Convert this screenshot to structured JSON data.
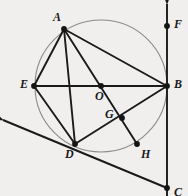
{
  "figure": {
    "kind": "geometry-diagram",
    "width": 188,
    "height": 196,
    "background_color": "#f0efee",
    "stroke_color": "#1a1a1a",
    "circle_color": "#8a8a8a",
    "point_color": "#141414"
  },
  "circle": {
    "label": "circle-O",
    "center_x": 101,
    "center_y": 86,
    "radius": 66,
    "stroke": "#8a8a8a",
    "stroke_width": 1.1
  },
  "points": [
    {
      "id": "A",
      "label": "A",
      "x": 64,
      "y": 29,
      "lx": 53,
      "ly": 11,
      "on_circle": true
    },
    {
      "id": "E",
      "label": "E",
      "x": 34,
      "y": 86,
      "lx": 20,
      "ly": 78,
      "on_circle": true
    },
    {
      "id": "B",
      "label": "B",
      "x": 167,
      "y": 86,
      "lx": 174,
      "ly": 78,
      "on_circle": true
    },
    {
      "id": "O",
      "label": "O",
      "x": 101,
      "y": 86,
      "lx": 95,
      "ly": 90,
      "on_circle": false
    },
    {
      "id": "D",
      "label": "D",
      "x": 75,
      "y": 144,
      "lx": 65,
      "ly": 148,
      "on_circle": true
    },
    {
      "id": "G",
      "label": "G",
      "x": 122,
      "y": 118,
      "lx": 105,
      "ly": 108,
      "on_circle": false
    },
    {
      "id": "H",
      "label": "H",
      "x": 137,
      "y": 144,
      "lx": 141,
      "ly": 148,
      "on_circle": false
    },
    {
      "id": "F",
      "label": "F",
      "x": 167,
      "y": 26,
      "lx": 174,
      "ly": 18,
      "on_circle": false
    },
    {
      "id": "C",
      "label": "C",
      "x": 167,
      "y": 188,
      "lx": 174,
      "ly": 186,
      "on_circle": false
    }
  ],
  "segments": [
    {
      "name": "segment-AE",
      "from": "A",
      "to": "E"
    },
    {
      "name": "segment-AB",
      "from": "A",
      "to": "B"
    },
    {
      "name": "segment-AH",
      "from": "A",
      "to": "H",
      "through": "G"
    },
    {
      "name": "segment-AD",
      "from": "A",
      "to": "D",
      "through": "O"
    },
    {
      "name": "segment-EB",
      "from": "E",
      "to": "B",
      "through": "O"
    },
    {
      "name": "segment-ED",
      "from": "E",
      "to": "D"
    },
    {
      "name": "segment-DB",
      "from": "D",
      "to": "B",
      "through": "G"
    }
  ],
  "rays": [
    {
      "name": "ray-tangent-through-D",
      "description": "line through D and C with arrowhead at upper-left",
      "x1": 3,
      "y1": 120,
      "x2": 167,
      "y2": 188,
      "arrow_at": "start"
    },
    {
      "name": "ray-vertical-FBC",
      "description": "vertical line through F, B and C with arrowhead at top",
      "x1": 167,
      "y1": 4,
      "x2": 167,
      "y2": 196,
      "arrow_at": "start"
    }
  ],
  "labels": {
    "A": "A",
    "B": "B",
    "C": "C",
    "D": "D",
    "E": "E",
    "F": "F",
    "G": "G",
    "H": "H",
    "O": "O"
  }
}
